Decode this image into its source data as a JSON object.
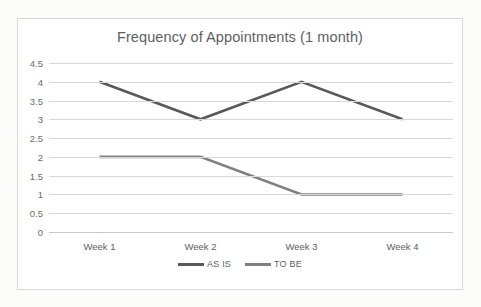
{
  "chart_data": {
    "type": "line",
    "title": "Frequency of Appointments (1 month)",
    "xlabel": "",
    "ylabel": "",
    "categories": [
      "Week 1",
      "Week 2",
      "Week 3",
      "Week 4"
    ],
    "series": [
      {
        "name": "AS IS",
        "values": [
          4,
          3,
          4,
          3
        ],
        "color": "#595959"
      },
      {
        "name": "TO BE",
        "values": [
          2,
          2,
          1,
          1
        ],
        "color": "#808080"
      }
    ],
    "ylim": [
      0,
      4.5
    ],
    "ytick_labels": [
      "4.5",
      "4",
      "3.5",
      "3",
      "2.5",
      "2",
      "1.5",
      "1",
      "0.5",
      "0"
    ],
    "ytick_values": [
      4.5,
      4,
      3.5,
      3,
      2.5,
      2,
      1.5,
      1,
      0.5,
      0
    ],
    "grid": true,
    "legend_position": "bottom"
  },
  "frame": {
    "border_color": "#d9d9d9",
    "background": "#ffffff"
  }
}
